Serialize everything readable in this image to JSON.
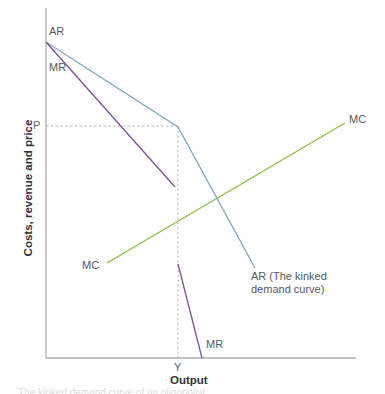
{
  "figure": {
    "background": "#ffffff",
    "width": 385,
    "height": 394
  },
  "axes": {
    "x_title": "Output",
    "y_title": "Costs, revenue and price",
    "axis_color": "#a9abae",
    "origin": {
      "x": 46,
      "y": 358
    },
    "x_end": {
      "x": 356,
      "y": 358
    },
    "y_top": {
      "x": 46,
      "y": 8
    }
  },
  "markers": {
    "price_label": "P",
    "quantity_label": "Y",
    "guide_color": "#b6b3ae",
    "price_y": 126,
    "quantity_x": 178
  },
  "labels": {
    "ar_axis": "AR",
    "mr_axis": "MR",
    "mc_left": "MC",
    "mc_right": "MC",
    "mr_bottom": "MR",
    "ar_curve": "AR (The kinked demand curve)"
  },
  "caption": "The kinked demand curve of an oligopolist",
  "chart_data": {
    "type": "line",
    "title": "",
    "subtitle": "",
    "xlabel": "Output",
    "ylabel": "Costs, revenue and price",
    "grid": false,
    "legend_position": "inline-labels",
    "xlim": [
      0,
      310
    ],
    "ylim": [
      0,
      350
    ],
    "annotations": [
      {
        "text": "P",
        "x": 0,
        "y": 232,
        "note": "price level on vertical axis"
      },
      {
        "text": "Y",
        "x": 132,
        "y": 0,
        "note": "profit-maximising output on horizontal axis"
      },
      {
        "text": "AR",
        "x": 3,
        "y": 316,
        "note": "start of average revenue curve"
      },
      {
        "text": "MR",
        "x": 3,
        "y": 297,
        "note": "start of marginal revenue curve"
      },
      {
        "text": "MC",
        "x": 61,
        "y": 95,
        "note": "left label of marginal cost curve"
      },
      {
        "text": "MC",
        "x": 303,
        "y": 235,
        "note": "right label of marginal cost curve"
      },
      {
        "text": "MR",
        "x": 160,
        "y": 20,
        "note": "label of lower marginal revenue segment"
      },
      {
        "text": "AR (The kinked demand curve)",
        "x": 207,
        "y": 82,
        "note": "label of demand curve"
      }
    ],
    "series": [
      {
        "name": "AR (The kinked demand curve)",
        "color": "#7fa8c0",
        "width": 1.3,
        "points_px": [
          [
            46,
            42
          ],
          [
            178,
            127
          ],
          [
            255,
            268
          ]
        ],
        "points_data": [
          [
            0,
            316
          ],
          [
            132,
            231
          ],
          [
            209,
            90
          ]
        ],
        "note": "kinked at (Y, P); shallow above the kink, steep below"
      },
      {
        "name": "MR upper segment",
        "color": "#7b5292",
        "width": 1.3,
        "points_px": [
          [
            46,
            42
          ],
          [
            175,
            187
          ]
        ],
        "points_data": [
          [
            0,
            316
          ],
          [
            129,
            171
          ]
        ],
        "note": "marginal revenue corresponding to the shallow demand segment"
      },
      {
        "name": "MR lower segment",
        "color": "#7b5292",
        "width": 1.3,
        "points_px": [
          [
            178,
            264
          ],
          [
            202,
            358
          ]
        ],
        "points_data": [
          [
            132,
            94
          ],
          [
            156,
            0
          ]
        ],
        "note": "marginal revenue corresponding to the steep demand segment; discontinuous gap at Y"
      },
      {
        "name": "MC",
        "color": "#8cbf3f",
        "width": 1.3,
        "points_px": [
          [
            107,
            263
          ],
          [
            345,
            123
          ]
        ],
        "points_data": [
          [
            61,
            95
          ],
          [
            299,
            235
          ]
        ],
        "note": "upward sloping marginal cost curve passing through the MR discontinuity"
      }
    ],
    "guides": [
      {
        "name": "price-guide",
        "style": "dashed",
        "color": "#b6b3ae",
        "from_px": [
          46,
          126
        ],
        "to_px": [
          178,
          126
        ],
        "note": "horizontal dashed line from P to the kink"
      },
      {
        "name": "quantity-guide",
        "style": "dashed",
        "color": "#b6b3ae",
        "from_px": [
          178,
          126
        ],
        "to_px": [
          178,
          358
        ],
        "note": "vertical dashed line from the kink down to Y"
      }
    ]
  }
}
